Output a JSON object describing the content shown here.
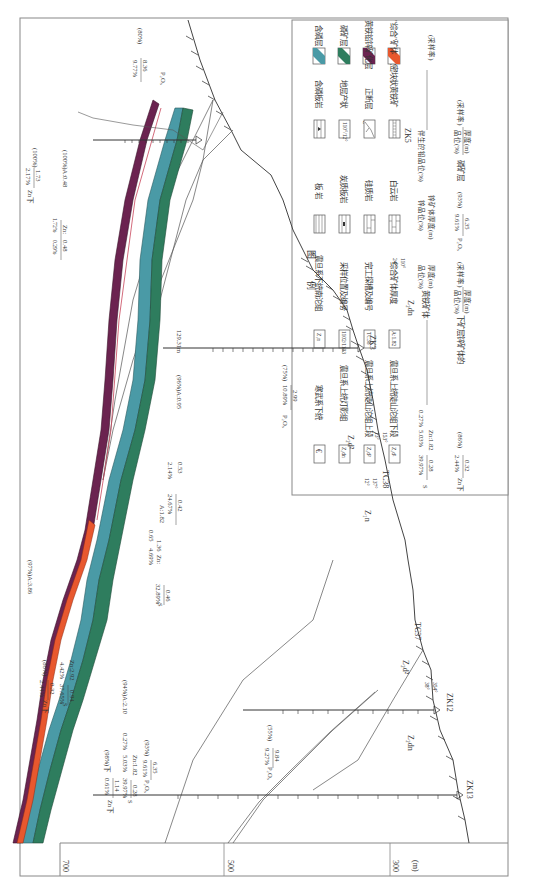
{
  "figure": {
    "orientation": "rotated-90-clockwise",
    "unit_label": "(m)",
    "elevation_ticks": [
      "700",
      "500",
      "300"
    ]
  },
  "colors": {
    "phosphorus_bearing": "#4a9aa6",
    "phosphorite": "#2e7d5e",
    "pyrite_lead_zinc": "#6b2350",
    "composite_ore": "#e8582e",
    "line": "#555555",
    "frame": "#888888"
  },
  "legend": {
    "title": "图    例",
    "rock_items": [
      {
        "symbol": "€",
        "label": "寒武系下统"
      },
      {
        "symbol": "Z₂dn",
        "label": "震旦系上统灯影组"
      },
      {
        "symbol": "Z₂d²",
        "label": "震旦系上统陡山沱组上段"
      },
      {
        "symbol": "Z₂d¹",
        "label": "震旦系上统陡山沱组下段"
      }
    ],
    "symbol_items": [
      {
        "symbol": "Z₁n",
        "label": "震旦系下统南沱组"
      },
      {
        "symbol": "1102/1103",
        "label": "采样位置及编号"
      },
      {
        "symbol": "TC38",
        "label": "完工探槽及编号"
      },
      {
        "symbol": "A:1.82",
        "label": "综合矿体厚度"
      }
    ],
    "lithology_items": [
      {
        "pattern": "slate",
        "label": "板  岩"
      },
      {
        "pattern": "carbonaceous-slate",
        "label": "炭质板岩"
      },
      {
        "pattern": "siliceous-rock",
        "label": "硅质岩"
      },
      {
        "pattern": "dolomite",
        "label": "白云岩"
      }
    ],
    "structure_items": [
      {
        "pattern": "phosphatic-slate",
        "label": "含磷板岩"
      },
      {
        "pattern": "attitude",
        "label": "地层产状",
        "value": "110°/12°"
      },
      {
        "pattern": "normal-fault",
        "label": "正断层"
      },
      {
        "pattern": "massive-pyrite",
        "label": "致密块状黄铁矿"
      }
    ],
    "layer_items": [
      {
        "color_key": "phosphorus_bearing",
        "label": "含磷层"
      },
      {
        "color_key": "phosphorite",
        "label": "磷矿层"
      },
      {
        "color_key": "pyrite_lead_zinc",
        "label": "黄铁铅锌矿化层"
      },
      {
        "color_key": "composite_ore",
        "label": "\"综合\"矿体"
      }
    ],
    "notes": {
      "pyrite_note_prefix": "S",
      "pyrite_num": "0.28",
      "pyrite_den": "39.97%",
      "zn_num": "Zn:1.82",
      "zn_den": "5.03%",
      "pb_den": "0.27%",
      "pyrite_caption_top": "厚度(m)",
      "pyrite_caption_bottom": "品位(%)",
      "pyrite_caption": "黄铁矿体",
      "zn_caption_top": "锌矿体厚度(m)",
      "zn_caption_mid": "锌品位(%)",
      "pb_caption": "伴生的铅品位(%)",
      "sample_rate": "(采样率)",
      "lower_zn_prefix": "Zn下",
      "lower_zn_num": "0.32",
      "lower_zn_den": "2.44%",
      "lower_zn_rate": "(86%)",
      "lower_zn_caption": "下矿层锌矿体的",
      "lower_zn_caption_top": "厚度(m)",
      "lower_zn_caption_bottom": "品位(%)",
      "lower_zn_caption_rate": "(采样率)",
      "p_prefix": "P₂O₅",
      "p_num": "6.35",
      "p_den": "9.61%",
      "p_rate": "(93%)",
      "p_caption": "磷矿层",
      "p_caption_top": "厚度(m)",
      "p_caption_bottom": "品位(%)",
      "p_caption_rate": "(采样率)"
    }
  },
  "section": {
    "drill_holes": [
      {
        "id": "ZK5",
        "label": "ZK5"
      },
      {
        "id": "ZK3",
        "label": "ZK3"
      },
      {
        "id": "ZK12",
        "label": "ZK12"
      },
      {
        "id": "ZK13",
        "label": "ZK13"
      }
    ],
    "trenches": [
      {
        "id": "TC38",
        "label": "TC38"
      },
      {
        "id": "TC37",
        "label": "TC37"
      }
    ],
    "formations": {
      "cambrian": "€",
      "dengying_top": "Z₂dn",
      "dengying_bottom": "Z₂dn",
      "doushantuo_upper_1": "Z₂d²",
      "doushantuo_upper_2": "Z₂d²",
      "nantuo": "Z₁n"
    },
    "attitudes": [
      {
        "az": "110°",
        "dip": "24°"
      },
      {
        "az": "153°",
        "dip": "13°"
      },
      {
        "az": "137°",
        "dip": "12°"
      },
      {
        "az": "354°",
        "dip": "38°"
      }
    ],
    "annotations": {
      "zk5_p": {
        "prefix": "P₂O₅",
        "num": "8.36",
        "den": "9.77%",
        "rate": "(80%)"
      },
      "zk5_zn": {
        "prefix": "Zn:",
        "num": "0.48",
        "den1": "1.72%",
        "den2": "0.29%",
        "tail": "(100%)A:0.48"
      },
      "zk5_zn_lower": {
        "prefix": "Zn下",
        "num": "1.73",
        "den": "2.17%",
        "rate": "(100%)"
      },
      "zk3_p": {
        "prefix": "P₂O₅",
        "num": "2.99",
        "den": "10.89%",
        "rate": "(75%)"
      },
      "zk3_a": {
        "text": "(96%)A:0.95"
      },
      "zk3_depth": {
        "text": "129.31m"
      },
      "zk3_samples": [
        "1025",
        "1031",
        "1032",
        "1033",
        "1034"
      ],
      "tc38_s": {
        "num": "0.42",
        "den": "24.67%",
        "zn": "0.53",
        "zn_den": "2.14%",
        "tail": "A:1.82"
      },
      "mid_zn": {
        "prefix": "Zn:",
        "num": "1.36",
        "den": "4.69%",
        "pb": "0.65"
      },
      "tc37_s": {
        "prefix": "S",
        "num": "0.46",
        "den": "32.89%",
        "tail": "(97%)A:3.86"
      },
      "zk12_s": {
        "prefix": "S",
        "num": "0.94",
        "den": "37.65%",
        "zn": "Zn:2.92",
        "zn_den": "4.42%"
      },
      "zk12_zn_lower": {
        "prefix": "Zn下",
        "num": "0.32",
        "den": "2.44%",
        "rate": "(86%)"
      },
      "zk12_p": {
        "prefix": "P₂O₅",
        "num": "9.84",
        "den": "9.27%",
        "rate": "(55%)"
      },
      "zk12_samples": [
        "1056",
        "1058"
      ],
      "zk13_p": {
        "prefix": "P₂O₅",
        "num": "6.35",
        "den": "9.61%",
        "rate": "(93%)"
      },
      "zk13_s": {
        "prefix": "S",
        "num": "0.28",
        "den": "39.97%",
        "zn": "Zn:1.82",
        "zn_den": "5.03%",
        "pb": "0.27%",
        "tail": "(94%)A:2.10"
      },
      "zk13_zn_lower": {
        "prefix": "Zn下",
        "num": "1.14",
        "den": "0.61%",
        "rate": "(98%)下"
      },
      "zk13_samples": [
        "10647",
        "10648",
        "10659",
        "1065"
      ]
    }
  }
}
